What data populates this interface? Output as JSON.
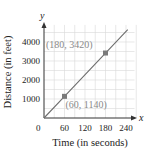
{
  "chart_data": {
    "type": "line",
    "title": "",
    "xlabel": "Time (in seconds)",
    "ylabel": "Distance (in feet)",
    "x_axis_var": "x",
    "y_axis_var": "y",
    "origin_label": "0",
    "x_ticks": [
      60,
      120,
      180,
      240
    ],
    "x_tick_labels": [
      "60",
      "120",
      "180",
      "240"
    ],
    "y_ticks": [
      1000,
      2000,
      3000,
      4000
    ],
    "y_tick_labels": [
      "1000",
      "2000",
      "3000",
      "4000"
    ],
    "xlim": [
      0,
      270
    ],
    "ylim": [
      0,
      5000
    ],
    "grid": true,
    "series": [
      {
        "name": "distance",
        "x": [
          0,
          60,
          180,
          245
        ],
        "y": [
          0,
          1140,
          3420,
          4655
        ],
        "color": "#6e6e6e"
      }
    ],
    "points": [
      {
        "x": 60,
        "y": 1140,
        "label": "(60, 1140)"
      },
      {
        "x": 180,
        "y": 3420,
        "label": "(180, 3420)"
      }
    ],
    "colors": {
      "line": "#6e6e6e",
      "marker": "#7a7a7a",
      "grid": "#d8d8d8",
      "axis": "#333333",
      "annotation": "#8a8a8a"
    }
  }
}
